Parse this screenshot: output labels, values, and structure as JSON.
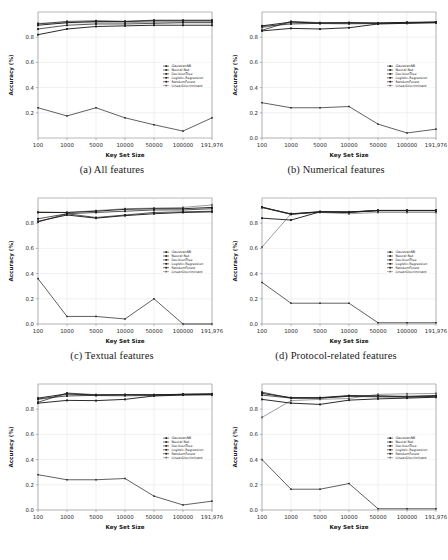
{
  "figure": {
    "name": "classifier-accuracy-grid",
    "layout": "2 columns x 3 rows of line charts"
  },
  "axes": {
    "xlabel": "Key Set Size",
    "ylabel": "Accuracy (%)",
    "xticklabels": [
      "100",
      "1000",
      "5000",
      "10000",
      "50000",
      "100000",
      "191,976"
    ],
    "yticklabels_full": [
      "0.0",
      "0.2",
      "0.4",
      "0.6",
      "0.8"
    ],
    "yticklabels_short": [
      "0.2",
      "0.4",
      "0.6",
      "0.8"
    ]
  },
  "legend": {
    "entries": [
      {
        "label": "GaussianNB",
        "marker": "square"
      },
      {
        "label": "Neural Net",
        "marker": "square"
      },
      {
        "label": "DecisionTree",
        "marker": "square"
      },
      {
        "label": "Logistic-Regression",
        "marker": "square"
      },
      {
        "label": "RandomForest",
        "marker": "square"
      },
      {
        "label": "LinearDiscriminant",
        "marker": "square"
      }
    ]
  },
  "captions": {
    "a": "(a) All features",
    "b": "(b) Numerical features",
    "c": "(c) Textual features",
    "d": "(d) Protocol-related features",
    "e": "",
    "f": ""
  },
  "colors": {
    "line": "#202020",
    "grid": "#e2e2ea",
    "axis": "#8a8a8a",
    "background": "#ffffff",
    "text": "#202020"
  },
  "chart_data": [
    {
      "panel": "a",
      "type": "line",
      "title": "(a) All features",
      "xlabel": "Key Set Size",
      "ylabel": "Accuracy (%)",
      "x": [
        "100",
        "1000",
        "5000",
        "10000",
        "50000",
        "100000",
        "191,976"
      ],
      "ylim": [
        0.0,
        1.0
      ],
      "yticks": [
        0.2,
        0.4,
        0.6,
        0.8
      ],
      "grid": true,
      "legend_position": "center-right",
      "series": [
        {
          "name": "GaussianNB",
          "values": [
            0.24,
            0.175,
            0.24,
            0.16,
            0.105,
            0.055,
            0.16
          ]
        },
        {
          "name": "Neural Net",
          "values": [
            0.905,
            0.925,
            0.93,
            0.925,
            0.935,
            0.935,
            0.935
          ]
        },
        {
          "name": "DecisionTree",
          "values": [
            0.82,
            0.865,
            0.885,
            0.89,
            0.895,
            0.895,
            0.895
          ]
        },
        {
          "name": "Logistic-Regression",
          "values": [
            0.865,
            0.895,
            0.905,
            0.905,
            0.91,
            0.915,
            0.915
          ]
        },
        {
          "name": "RandomForest",
          "values": [
            0.895,
            0.915,
            0.925,
            0.925,
            0.93,
            0.93,
            0.93
          ]
        },
        {
          "name": "LinearDiscriminant",
          "values": [
            0.91,
            0.915,
            0.915,
            0.915,
            0.92,
            0.92,
            0.92
          ]
        }
      ]
    },
    {
      "panel": "b",
      "type": "line",
      "title": "(b) Numerical features",
      "xlabel": "Key Set Size",
      "ylabel": "Accuracy (%)",
      "x": [
        "100",
        "1000",
        "5000",
        "10000",
        "50000",
        "100000",
        "191,976"
      ],
      "ylim": [
        0.0,
        1.0
      ],
      "yticks": [
        0.0,
        0.2,
        0.4,
        0.6,
        0.8
      ],
      "grid": true,
      "legend_position": "center-right",
      "series": [
        {
          "name": "GaussianNB",
          "values": [
            0.28,
            0.24,
            0.24,
            0.25,
            0.11,
            0.04,
            0.07
          ]
        },
        {
          "name": "Neural Net",
          "values": [
            0.855,
            0.925,
            0.915,
            0.915,
            0.91,
            0.915,
            0.92
          ]
        },
        {
          "name": "DecisionTree",
          "values": [
            0.85,
            0.87,
            0.865,
            0.875,
            0.905,
            0.91,
            0.915
          ]
        },
        {
          "name": "Logistic-Regression",
          "values": [
            0.885,
            0.905,
            0.91,
            0.91,
            0.912,
            0.915,
            0.918
          ]
        },
        {
          "name": "RandomForest",
          "values": [
            0.89,
            0.92,
            0.912,
            0.915,
            0.912,
            0.918,
            0.92
          ]
        },
        {
          "name": "LinearDiscriminant",
          "values": [
            0.875,
            0.915,
            0.908,
            0.905,
            0.908,
            0.912,
            0.915
          ]
        }
      ]
    },
    {
      "panel": "c",
      "type": "line",
      "title": "(c) Textual features",
      "xlabel": "Key Set Size",
      "ylabel": "Accuracy (%)",
      "x": [
        "100",
        "1000",
        "5000",
        "10000",
        "50000",
        "100000",
        "191,976"
      ],
      "ylim": [
        0.0,
        1.0
      ],
      "yticks": [
        0.0,
        0.2,
        0.4,
        0.6,
        0.8
      ],
      "grid": true,
      "legend_position": "center-right",
      "series": [
        {
          "name": "GaussianNB",
          "values": [
            0.36,
            0.06,
            0.06,
            0.04,
            0.2,
            0.0,
            0.0
          ]
        },
        {
          "name": "Neural Net",
          "values": [
            0.81,
            0.875,
            0.845,
            0.865,
            0.885,
            0.89,
            0.895
          ]
        },
        {
          "name": "DecisionTree",
          "values": [
            0.815,
            0.865,
            0.84,
            0.86,
            0.875,
            0.885,
            0.89
          ]
        },
        {
          "name": "Logistic-Regression",
          "values": [
            0.835,
            0.875,
            0.885,
            0.895,
            0.905,
            0.905,
            0.915
          ]
        },
        {
          "name": "RandomForest",
          "values": [
            0.885,
            0.885,
            0.895,
            0.91,
            0.915,
            0.915,
            0.925
          ]
        },
        {
          "name": "LinearDiscriminant",
          "values": [
            0.89,
            0.885,
            0.9,
            0.915,
            0.92,
            0.925,
            0.945
          ]
        }
      ]
    },
    {
      "panel": "d",
      "type": "line",
      "title": "(d) Protocol-related features",
      "xlabel": "Key Set Size",
      "ylabel": "Accuracy (%)",
      "x": [
        "100",
        "1000",
        "5000",
        "10000",
        "50000",
        "100000",
        "191,976"
      ],
      "ylim": [
        0.0,
        1.0
      ],
      "yticks": [
        0.0,
        0.2,
        0.4,
        0.6,
        0.8
      ],
      "grid": true,
      "legend_position": "center-right",
      "series": [
        {
          "name": "GaussianNB",
          "values": [
            0.33,
            0.165,
            0.165,
            0.165,
            0.01,
            0.01,
            0.01
          ]
        },
        {
          "name": "Neural Net",
          "values": [
            0.925,
            0.87,
            0.89,
            0.885,
            0.9,
            0.9,
            0.9
          ]
        },
        {
          "name": "DecisionTree",
          "values": [
            0.84,
            0.825,
            0.89,
            0.89,
            0.9,
            0.9,
            0.9
          ]
        },
        {
          "name": "Logistic-Regression",
          "values": [
            0.925,
            0.875,
            0.892,
            0.888,
            0.902,
            0.902,
            0.902
          ]
        },
        {
          "name": "RandomForest",
          "values": [
            0.928,
            0.872,
            0.89,
            0.887,
            0.9,
            0.9,
            0.9
          ]
        },
        {
          "name": "LinearDiscriminant",
          "values": [
            0.61,
            0.875,
            0.885,
            0.875,
            0.885,
            0.885,
            0.885
          ]
        }
      ]
    },
    {
      "panel": "e",
      "type": "line",
      "title": "",
      "xlabel": "Key Set Size",
      "ylabel": "Accuracy (%)",
      "x": [
        "100",
        "1000",
        "5000",
        "10000",
        "50000",
        "100000",
        "191,976"
      ],
      "ylim": [
        0.0,
        1.0
      ],
      "yticks": [
        0.0,
        0.2,
        0.4,
        0.6,
        0.8
      ],
      "grid": true,
      "legend_position": "center-right",
      "series": [
        {
          "name": "GaussianNB",
          "values": [
            0.28,
            0.24,
            0.24,
            0.25,
            0.11,
            0.04,
            0.07
          ]
        },
        {
          "name": "Neural Net",
          "values": [
            0.855,
            0.928,
            0.915,
            0.915,
            0.912,
            0.918,
            0.92
          ]
        },
        {
          "name": "DecisionTree",
          "values": [
            0.848,
            0.87,
            0.868,
            0.878,
            0.905,
            0.912,
            0.915
          ]
        },
        {
          "name": "Logistic-Regression",
          "values": [
            0.882,
            0.905,
            0.91,
            0.912,
            0.912,
            0.918,
            0.918
          ]
        },
        {
          "name": "RandomForest",
          "values": [
            0.888,
            0.922,
            0.912,
            0.915,
            0.915,
            0.918,
            0.922
          ]
        },
        {
          "name": "LinearDiscriminant",
          "values": [
            0.875,
            0.918,
            0.908,
            0.905,
            0.908,
            0.915,
            0.915
          ]
        }
      ]
    },
    {
      "panel": "f",
      "type": "line",
      "title": "",
      "xlabel": "Key Set Size",
      "ylabel": "Accuracy (%)",
      "x": [
        "100",
        "1000",
        "5000",
        "10000",
        "50000",
        "100000",
        "191,976"
      ],
      "ylim": [
        0.0,
        1.0
      ],
      "yticks": [
        0.0,
        0.2,
        0.4,
        0.6,
        0.8
      ],
      "grid": true,
      "legend_position": "center-right",
      "series": [
        {
          "name": "GaussianNB",
          "values": [
            0.4,
            0.165,
            0.165,
            0.21,
            0.01,
            0.01,
            0.01
          ]
        },
        {
          "name": "Neural Net",
          "values": [
            0.935,
            0.888,
            0.888,
            0.905,
            0.905,
            0.898,
            0.905
          ]
        },
        {
          "name": "DecisionTree",
          "values": [
            0.878,
            0.848,
            0.838,
            0.872,
            0.882,
            0.888,
            0.895
          ]
        },
        {
          "name": "Logistic-Regression",
          "values": [
            0.912,
            0.888,
            0.888,
            0.902,
            0.898,
            0.895,
            0.902
          ]
        },
        {
          "name": "RandomForest",
          "values": [
            0.925,
            0.892,
            0.892,
            0.908,
            0.905,
            0.902,
            0.908
          ]
        },
        {
          "name": "LinearDiscriminant",
          "values": [
            0.735,
            0.868,
            0.878,
            0.885,
            0.918,
            0.922,
            0.925
          ]
        }
      ]
    }
  ]
}
